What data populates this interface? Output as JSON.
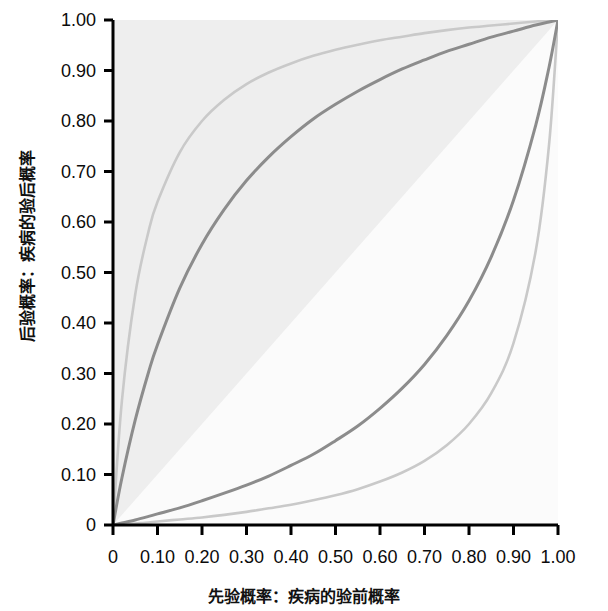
{
  "chart_data": {
    "type": "line",
    "title": "",
    "xlabel": "先验概率：疾病的验前概率",
    "ylabel": "后验概率：疾病的验后概率",
    "xlim": [
      0,
      1.0
    ],
    "ylim": [
      0,
      1.0
    ],
    "grid": false,
    "legend": "none",
    "xticks": [
      "0",
      "0.10",
      "0.20",
      "0.30",
      "0.40",
      "0.50",
      "0.60",
      "0.70",
      "0.80",
      "0.90",
      "1.00"
    ],
    "xtick_values": [
      0,
      0.1,
      0.2,
      0.3,
      0.4,
      0.5,
      0.6,
      0.7,
      0.8,
      0.9,
      1.0
    ],
    "yticks": [
      "0",
      "0.10",
      "0.20",
      "0.30",
      "0.40",
      "0.50",
      "0.60",
      "0.70",
      "0.80",
      "0.90",
      "1.00"
    ],
    "ytick_values": [
      0,
      0.1,
      0.2,
      0.3,
      0.4,
      0.5,
      0.6,
      0.7,
      0.8,
      0.9,
      1.0
    ],
    "x": [
      0,
      0.02,
      0.05,
      0.08,
      0.1,
      0.15,
      0.2,
      0.25,
      0.3,
      0.35,
      0.4,
      0.45,
      0.5,
      0.55,
      0.6,
      0.65,
      0.7,
      0.75,
      0.8,
      0.85,
      0.9,
      0.95,
      0.98,
      1.0
    ],
    "series": [
      {
        "name": "LR = 16 (light gray, upper)",
        "color": "#c9c9c9",
        "values": [
          0,
          0.246,
          0.457,
          0.582,
          0.64,
          0.738,
          0.8,
          0.842,
          0.873,
          0.896,
          0.914,
          0.929,
          0.941,
          0.951,
          0.96,
          0.967,
          0.974,
          0.98,
          0.985,
          0.989,
          0.993,
          0.997,
          0.999,
          1.0
        ]
      },
      {
        "name": "LR = 5 (dark gray, upper)",
        "color": "#8c8c8c",
        "values": [
          0,
          0.093,
          0.208,
          0.303,
          0.357,
          0.469,
          0.556,
          0.625,
          0.682,
          0.729,
          0.769,
          0.804,
          0.833,
          0.859,
          0.882,
          0.903,
          0.921,
          0.938,
          0.952,
          0.966,
          0.978,
          0.99,
          0.996,
          1.0
        ]
      },
      {
        "name": "LR = 0.2 (dark gray, lower)",
        "color": "#8c8c8c",
        "values": [
          0,
          0.004,
          0.01,
          0.017,
          0.022,
          0.034,
          0.048,
          0.063,
          0.079,
          0.097,
          0.118,
          0.14,
          0.167,
          0.196,
          0.231,
          0.271,
          0.318,
          0.375,
          0.444,
          0.531,
          0.643,
          0.792,
          0.907,
          1.0
        ]
      },
      {
        "name": "LR = 0.0625 (light gray, lower)",
        "color": "#c9c9c9",
        "values": [
          0,
          0.001,
          0.003,
          0.005,
          0.007,
          0.011,
          0.015,
          0.02,
          0.026,
          0.033,
          0.04,
          0.049,
          0.059,
          0.071,
          0.086,
          0.104,
          0.127,
          0.158,
          0.2,
          0.261,
          0.36,
          0.543,
          0.754,
          1.0
        ]
      },
      {
        "name": "LR = 1 (reference diagonal / shading boundary)",
        "color": "#efefef",
        "values": [
          0,
          0.02,
          0.05,
          0.08,
          0.1,
          0.15,
          0.2,
          0.25,
          0.3,
          0.35,
          0.4,
          0.45,
          0.5,
          0.55,
          0.6,
          0.65,
          0.7,
          0.75,
          0.8,
          0.85,
          0.9,
          0.95,
          0.98,
          1.0
        ]
      }
    ],
    "shading": {
      "above_diagonal_color": "#eeeeee",
      "below_diagonal_color": "#fbfbfb"
    },
    "axis_color": "#000000",
    "plot_background": "#eeeeee"
  }
}
